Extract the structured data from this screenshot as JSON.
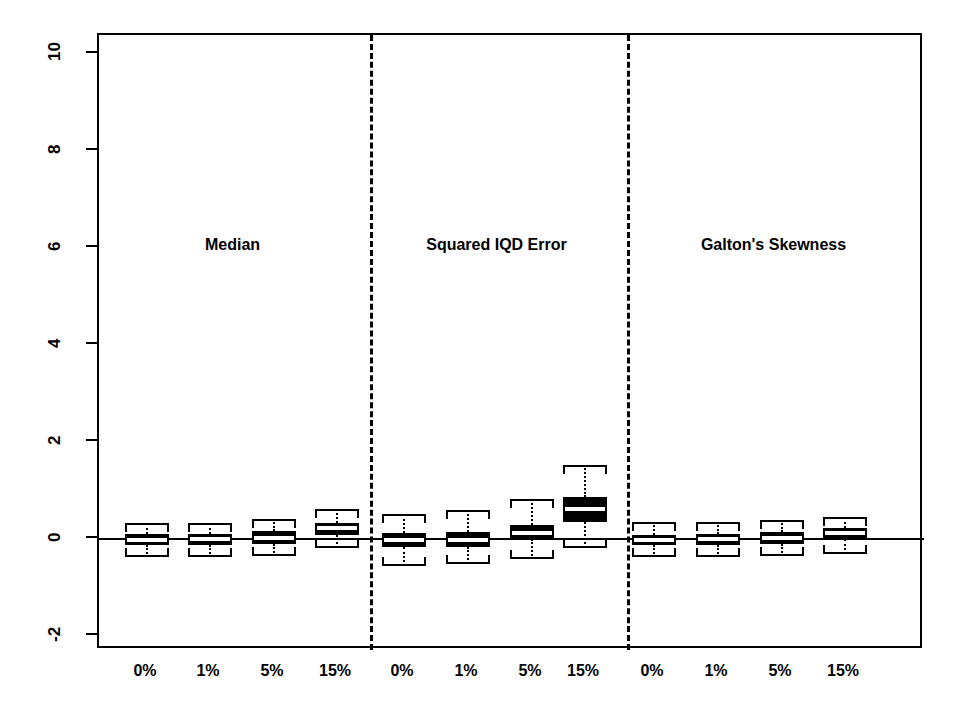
{
  "chart_data": {
    "type": "boxplot",
    "title": "",
    "xlabel": "",
    "ylabel": "",
    "ylim": [
      -2.9,
      10.7
    ],
    "grid": false,
    "legend": null,
    "yticks": [
      -2,
      0,
      2,
      4,
      6,
      8,
      10
    ],
    "ytick_labels": [
      "-2",
      "0",
      "2",
      "4",
      "6",
      "8",
      "10"
    ],
    "reference_line": 0,
    "panels": [
      {
        "label": "Median",
        "categories": [
          "0%",
          "1%",
          "5%",
          "15%"
        ],
        "boxes": [
          {
            "category": "0%",
            "whisker_low": -0.38,
            "q1": -0.13,
            "median": -0.02,
            "q3": 0.1,
            "whisker_high": 0.34
          },
          {
            "category": "1%",
            "whisker_low": -0.38,
            "q1": -0.13,
            "median": -0.01,
            "q3": 0.11,
            "whisker_high": 0.34
          },
          {
            "category": "5%",
            "whisker_low": -0.36,
            "q1": -0.1,
            "median": 0.03,
            "q3": 0.16,
            "whisker_high": 0.41
          },
          {
            "category": "15%",
            "whisker_low": -0.19,
            "q1": 0.09,
            "median": 0.22,
            "q3": 0.34,
            "whisker_high": 0.62
          }
        ]
      },
      {
        "label": "Squared IQD Error",
        "categories": [
          "0%",
          "1%",
          "5%",
          "15%"
        ],
        "boxes": [
          {
            "category": "0%",
            "whisker_low": -0.55,
            "q1": -0.17,
            "median": -0.03,
            "q3": 0.13,
            "whisker_high": 0.52
          },
          {
            "category": "1%",
            "whisker_low": -0.52,
            "q1": -0.17,
            "median": -0.02,
            "q3": 0.14,
            "whisker_high": 0.59
          },
          {
            "category": "5%",
            "whisker_low": -0.41,
            "q1": 0.0,
            "median": 0.13,
            "q3": 0.29,
            "whisker_high": 0.83
          },
          {
            "category": "15%",
            "whisker_low": -0.18,
            "q1": 0.35,
            "median": 0.61,
            "q3": 0.86,
            "whisker_high": 1.52
          }
        ]
      },
      {
        "label": "Galton's Skewness",
        "categories": [
          "0%",
          "1%",
          "5%",
          "15%"
        ],
        "boxes": [
          {
            "category": "0%",
            "whisker_low": -0.38,
            "q1": -0.13,
            "median": -0.02,
            "q3": 0.09,
            "whisker_high": 0.35
          },
          {
            "category": "1%",
            "whisker_low": -0.38,
            "q1": -0.13,
            "median": -0.01,
            "q3": 0.1,
            "whisker_high": 0.36
          },
          {
            "category": "5%",
            "whisker_low": -0.36,
            "q1": -0.1,
            "median": 0.02,
            "q3": 0.14,
            "whisker_high": 0.39
          },
          {
            "category": "15%",
            "whisker_low": -0.3,
            "q1": 0.0,
            "median": 0.12,
            "q3": 0.23,
            "whisker_high": 0.46
          }
        ]
      }
    ],
    "colors": {
      "box_fill": "#000000",
      "box_edge": "#000000",
      "median": "#ffffff",
      "whisker": "#000000",
      "frame": "#000000",
      "background": "#ffffff"
    }
  }
}
